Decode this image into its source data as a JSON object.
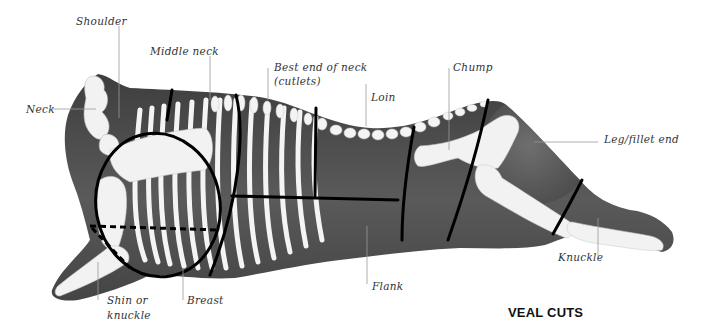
{
  "diagram": {
    "title": "VEAL CUTS",
    "colors": {
      "body_fill": "#4a4a4a",
      "body_light": "#7a7a7a",
      "bone": "#f4f4f4",
      "cut_line": "#000000",
      "leader_line": "#9a9a9a",
      "label_text": "#333333"
    },
    "labels": [
      {
        "id": "shoulder",
        "text": "Shoulder"
      },
      {
        "id": "middle-neck",
        "text": "Middle neck"
      },
      {
        "id": "best-end-of-neck",
        "text": "Best end of neck",
        "text2": "(cutlets)"
      },
      {
        "id": "loin",
        "text": "Loin"
      },
      {
        "id": "chump",
        "text": "Chump"
      },
      {
        "id": "neck",
        "text": "Neck"
      },
      {
        "id": "leg-fillet-end",
        "text": "Leg/fillet end"
      },
      {
        "id": "knuckle",
        "text": "Knuckle"
      },
      {
        "id": "flank",
        "text": "Flank"
      },
      {
        "id": "breast",
        "text": "Breast"
      },
      {
        "id": "shin-or-knuckle",
        "text": "Shin or",
        "text2": "knuckle"
      }
    ]
  }
}
